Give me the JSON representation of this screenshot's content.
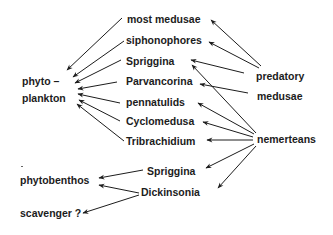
{
  "diagram": {
    "type": "food-web",
    "colors": {
      "background": "#ffffff",
      "ink": "#1c1c1c"
    },
    "nodes": {
      "most_medusae": "most   medusae",
      "siphonophores": "siphonophores",
      "spriggina_1": "Spriggina",
      "parvancorina": "Parvancorina",
      "pennatulids": "pennatulids",
      "cyclomedusa": "Cyclomedusa",
      "tribrachidium": "Tribrachidium",
      "phyto_line1": "phyto –",
      "phyto_line2": "plankton",
      "predatory_line1": "predatory",
      "predatory_line2": "medusae",
      "nemerteans": "nemerteans",
      "spriggina_2": "Spriggina",
      "dickinsonia": "Dickinsonia",
      "phytobenthos": "phytobenthos",
      "scavenger": "scavenger ?"
    },
    "edges": [
      {
        "from": "most medusae",
        "to": "phyto-plankton"
      },
      {
        "from": "siphonophores",
        "to": "phyto-plankton"
      },
      {
        "from": "Spriggina",
        "to": "phyto-plankton"
      },
      {
        "from": "Parvancorina",
        "to": "phyto-plankton"
      },
      {
        "from": "pennatulids",
        "to": "phyto-plankton"
      },
      {
        "from": "Cyclomedusa",
        "to": "phyto-plankton"
      },
      {
        "from": "Tribrachidium",
        "to": "phyto-plankton"
      },
      {
        "from": "predatory medusae",
        "to": "most medusae"
      },
      {
        "from": "predatory medusae",
        "to": "siphonophores"
      },
      {
        "from": "predatory medusae",
        "to": "Spriggina"
      },
      {
        "from": "predatory medusae",
        "to": "Parvancorina"
      },
      {
        "from": "nemerteans",
        "to": "Spriggina"
      },
      {
        "from": "nemerteans",
        "to": "pennatulids"
      },
      {
        "from": "nemerteans",
        "to": "Cyclomedusa"
      },
      {
        "from": "nemerteans",
        "to": "Tribrachidium"
      },
      {
        "from": "nemerteans",
        "to": "Spriggina (benthic)"
      },
      {
        "from": "nemerteans",
        "to": "Dickinsonia"
      },
      {
        "from": "Spriggina (benthic)",
        "to": "phytobenthos"
      },
      {
        "from": "Dickinsonia",
        "to": "phytobenthos"
      },
      {
        "from": "Dickinsonia",
        "to": "scavenger ?"
      }
    ]
  }
}
